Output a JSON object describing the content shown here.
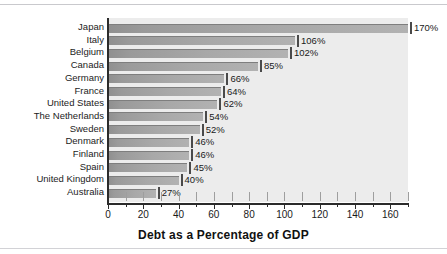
{
  "chart_data": {
    "type": "bar",
    "orientation": "horizontal",
    "title": "",
    "xlabel": "Debt as a Percentage of GDP",
    "ylabel": "",
    "xlim": [
      0,
      170
    ],
    "xticks": [
      0,
      20,
      40,
      60,
      80,
      100,
      120,
      140,
      160
    ],
    "xtick_labels": [
      "0",
      "20",
      "40",
      "60",
      "80",
      "100",
      "120",
      "140",
      "160"
    ],
    "minor_tick_step": 10,
    "grid": false,
    "legend": null,
    "value_label_suffix": "%",
    "categories": [
      "Japan",
      "Italy",
      "Belgium",
      "Canada",
      "Germany",
      "France",
      "United States",
      "The Netherlands",
      "Sweden",
      "Denmark",
      "Finland",
      "Spain",
      "United Kingdom",
      "Australia"
    ],
    "values": [
      170,
      106,
      102,
      85,
      66,
      64,
      62,
      54,
      52,
      46,
      46,
      45,
      40,
      27
    ],
    "value_labels": [
      "170%",
      "106%",
      "102%",
      "85%",
      "66%",
      "64%",
      "62%",
      "54%",
      "52%",
      "46%",
      "46%",
      "45%",
      "40%",
      "27%"
    ],
    "colors": {
      "bar_fill_dark": "#8f8f8f",
      "bar_fill_light": "#b2b2b2",
      "bar_edge": "#7e7e7e",
      "plot_background": "#ececec",
      "axis": "#2b2b2b",
      "text": "#1a1a1a",
      "page_background": "#ffffff",
      "rule": "#c9c9cd"
    }
  }
}
